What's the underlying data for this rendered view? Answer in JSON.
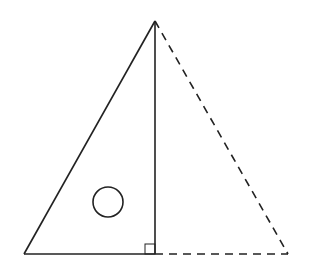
{
  "diagram": {
    "type": "geometry",
    "stroke_color": "#222222",
    "background": "#ffffff",
    "points": {
      "apex": [
        155,
        21
      ],
      "bottom_left": [
        24,
        254
      ],
      "foot": [
        155,
        254
      ],
      "bottom_right": [
        288,
        254
      ]
    },
    "solid_segments": [
      {
        "name": "hypotenuse-left",
        "from": "bottom_left",
        "to": "apex"
      },
      {
        "name": "altitude",
        "from": "apex",
        "to": "foot"
      },
      {
        "name": "base-left",
        "from": "bottom_left",
        "to": "foot"
      }
    ],
    "dashed_segments": [
      {
        "name": "side-right",
        "from": "apex",
        "to": "bottom_right"
      },
      {
        "name": "base-right",
        "from": "foot",
        "to": "bottom_right"
      }
    ],
    "circle": {
      "cx": 108,
      "cy": 202,
      "r": 15
    },
    "right_angle_marker": {
      "x": 145,
      "y": 244,
      "size": 10
    }
  }
}
